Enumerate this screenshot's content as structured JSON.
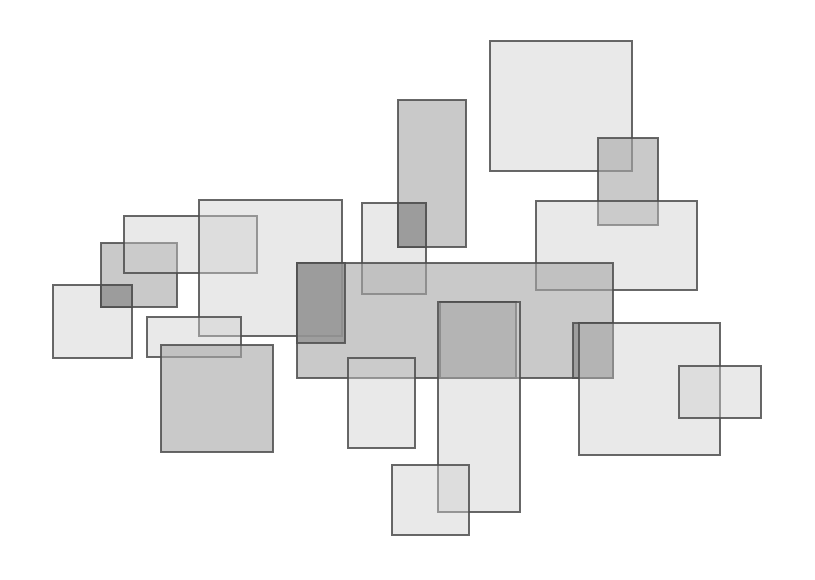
{
  "canvas": {
    "width": 815,
    "height": 580,
    "background": "#ffffff",
    "title": "overlapping-rectangles-composition"
  },
  "style": {
    "stroke_color": "#4d4d4d",
    "stroke_width": 1.6,
    "fill_light": "#cfcfcf",
    "fill_medium": "#a8a8a8",
    "fill_dark": "#8f8f8f",
    "fill_opacity_light": 0.45,
    "fill_opacity_medium": 0.62,
    "fill_opacity_dark": 0.75
  },
  "chart_data": {
    "type": "scatter",
    "title": "",
    "subtitle": "",
    "xlabel": "",
    "ylabel": "",
    "xlim": [
      0,
      815
    ],
    "ylim": [
      0,
      580
    ],
    "grid": false,
    "legend": null,
    "annotations": [],
    "tick_labels": {
      "x": [],
      "y": []
    },
    "note": "Abstract composition of 22 axis-aligned semi-transparent rectangles (glyph/marker style plot). Values are pixel geometry: x, y, width, height.",
    "rectangles": [
      {
        "id": "rect-01",
        "name": "left-small-light-square",
        "x": 53,
        "y": 285,
        "width": 79,
        "height": 73,
        "tone": "light"
      },
      {
        "id": "rect-02",
        "name": "left-medium-rect",
        "x": 101,
        "y": 243,
        "width": 76,
        "height": 64,
        "tone": "medium"
      },
      {
        "id": "rect-03",
        "name": "upper-left-light-rect",
        "x": 124,
        "y": 216,
        "width": 133,
        "height": 57,
        "tone": "light"
      },
      {
        "id": "rect-04",
        "name": "large-upper-left-light-square",
        "x": 199,
        "y": 200,
        "width": 143,
        "height": 136,
        "tone": "light"
      },
      {
        "id": "rect-05",
        "name": "mid-left-thin-light-rect",
        "x": 147,
        "y": 317,
        "width": 94,
        "height": 40,
        "tone": "light"
      },
      {
        "id": "rect-06",
        "name": "lower-left-medium-square",
        "x": 161,
        "y": 345,
        "width": 112,
        "height": 107,
        "tone": "medium"
      },
      {
        "id": "rect-07",
        "name": "upper-mid-light-rect",
        "x": 362,
        "y": 203,
        "width": 64,
        "height": 91,
        "tone": "light"
      },
      {
        "id": "rect-08",
        "name": "tall-upper-medium-rect",
        "x": 398,
        "y": 100,
        "width": 68,
        "height": 147,
        "tone": "medium"
      },
      {
        "id": "rect-09",
        "name": "top-right-large-light-square",
        "x": 490,
        "y": 41,
        "width": 142,
        "height": 130,
        "tone": "light"
      },
      {
        "id": "rect-10",
        "name": "upper-right-medium-rect",
        "x": 598,
        "y": 138,
        "width": 60,
        "height": 87,
        "tone": "medium"
      },
      {
        "id": "rect-11",
        "name": "right-wide-light-rect",
        "x": 536,
        "y": 201,
        "width": 161,
        "height": 89,
        "tone": "light"
      },
      {
        "id": "rect-12",
        "name": "central-large-medium-rect",
        "x": 297,
        "y": 263,
        "width": 316,
        "height": 115,
        "tone": "medium"
      },
      {
        "id": "rect-13",
        "name": "central-dark-square",
        "x": 440,
        "y": 302,
        "width": 76,
        "height": 76,
        "tone": "dark"
      },
      {
        "id": "rect-14",
        "name": "central-left-dark-rect",
        "x": 297,
        "y": 263,
        "width": 48,
        "height": 80,
        "tone": "dark"
      },
      {
        "id": "rect-15",
        "name": "central-right-dark-rect",
        "x": 573,
        "y": 323,
        "width": 40,
        "height": 55,
        "tone": "dark"
      },
      {
        "id": "rect-16",
        "name": "lower-mid-small-light-rect",
        "x": 348,
        "y": 358,
        "width": 67,
        "height": 90,
        "tone": "light"
      },
      {
        "id": "rect-17",
        "name": "lower-mid-tall-light-rect",
        "x": 438,
        "y": 302,
        "width": 82,
        "height": 210,
        "tone": "light"
      },
      {
        "id": "rect-18",
        "name": "bottom-light-square",
        "x": 392,
        "y": 465,
        "width": 77,
        "height": 70,
        "tone": "light"
      },
      {
        "id": "rect-19",
        "name": "bottom-right-large-light-rect",
        "x": 579,
        "y": 323,
        "width": 141,
        "height": 132,
        "tone": "light"
      },
      {
        "id": "rect-20",
        "name": "far-right-small-light-rect",
        "x": 679,
        "y": 366,
        "width": 82,
        "height": 52,
        "tone": "light"
      },
      {
        "id": "rect-21",
        "name": "left-overlap-dark-square",
        "x": 101,
        "y": 285,
        "width": 31,
        "height": 22,
        "tone": "dark"
      },
      {
        "id": "rect-22",
        "name": "upper-mid-overlap-medium-rect",
        "x": 398,
        "y": 203,
        "width": 28,
        "height": 44,
        "tone": "dark"
      }
    ]
  }
}
